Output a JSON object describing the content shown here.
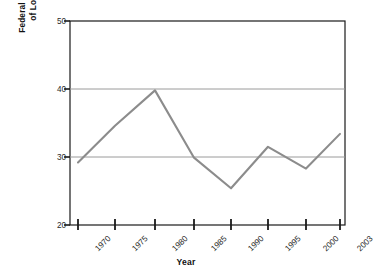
{
  "chart_data": {
    "type": "line",
    "title": "",
    "xlabel": "Year",
    "ylabel_line1": "Federal Grants-in-Aid as Percentage",
    "ylabel_line2": "of Local Governments' Budget",
    "categories": [
      "1970",
      "1975",
      "1980",
      "1985",
      "1990",
      "1995",
      "2000",
      "2003"
    ],
    "values": [
      29.2,
      34.6,
      39.8,
      29.9,
      25.4,
      31.5,
      28.3,
      33.4
    ],
    "ylim": [
      20,
      50
    ],
    "yticks": [
      20,
      30,
      40,
      50
    ],
    "ytick_labels": [
      "20",
      "30",
      "40",
      "50"
    ],
    "grid": true,
    "grid_axis": "y",
    "legend": "none",
    "series_color": "#8c8c8c",
    "axis_color": "#1a1a1a",
    "grid_color": "#999999"
  }
}
